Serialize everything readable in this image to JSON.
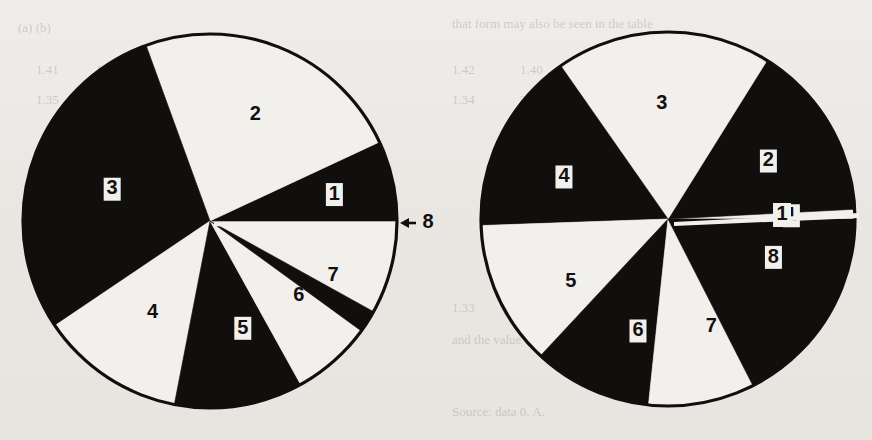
{
  "figure": {
    "title": "",
    "background_color": "#eceae6",
    "ink_color": "#100f0e",
    "paper_color": "#f2f0ec"
  },
  "ghost_text": [
    {
      "text": "(a)  (b)",
      "x": 18,
      "y": 20
    },
    {
      "text": "that   form   may   also   be   seen   in   the   table",
      "x": 452,
      "y": 16
    },
    {
      "text": "1.41",
      "x": 36,
      "y": 62
    },
    {
      "text": "1.38",
      "x": 96,
      "y": 62
    },
    {
      "text": "21",
      "x": 160,
      "y": 62
    },
    {
      "text": "1.42",
      "x": 452,
      "y": 62
    },
    {
      "text": "1.40",
      "x": 520,
      "y": 62
    },
    {
      "text": "23",
      "x": 586,
      "y": 62
    },
    {
      "text": "1.35",
      "x": 36,
      "y": 92
    },
    {
      "text": "2.06",
      "x": 96,
      "y": 92
    },
    {
      "text": "1.44",
      "x": 160,
      "y": 92
    },
    {
      "text": "1.34",
      "x": 452,
      "y": 92
    },
    {
      "text": "2.01",
      "x": 520,
      "y": 92
    },
    {
      "text": "1.46",
      "x": 586,
      "y": 92
    },
    {
      "text": "1.33",
      "x": 452,
      "y": 300
    },
    {
      "text": "0.91",
      "x": 520,
      "y": 300
    },
    {
      "text": "1.52",
      "x": 586,
      "y": 300
    },
    {
      "text": "and   the   value   of   (1)   is   then   taken   as",
      "x": 452,
      "y": 332
    },
    {
      "text": "Source:  data  0.  A.",
      "x": 452,
      "y": 404
    }
  ],
  "chart_data": [
    {
      "id": "left-pie",
      "type": "pie",
      "title": "",
      "caption": "",
      "center": {
        "x": 210,
        "y": 221
      },
      "radius": 187,
      "start_angle_deg": 0,
      "direction": "counterclockwise",
      "legend": "none",
      "labels_inside": true,
      "slices": [
        {
          "label": "1",
          "value": 25.0,
          "fill": "black",
          "label_fill": "light-box",
          "label_angle_deg": 12.0,
          "label_r_frac": 0.68
        },
        {
          "label": "2",
          "value": 85.0,
          "fill": "white",
          "label_fill": "dark",
          "label_angle_deg": 67.0,
          "label_r_frac": 0.62
        },
        {
          "label": "3",
          "value": 104.0,
          "fill": "black",
          "label_fill": "light-box",
          "label_angle_deg": 162.0,
          "label_r_frac": 0.55
        },
        {
          "label": "4",
          "value": 45.0,
          "fill": "white",
          "label_fill": "dark",
          "label_angle_deg": 238.0,
          "label_r_frac": 0.58
        },
        {
          "label": "5",
          "value": 40.0,
          "fill": "black",
          "label_fill": "light-box",
          "label_angle_deg": 287.0,
          "label_r_frac": 0.6
        },
        {
          "label": "6",
          "value": 22.0,
          "fill": "white",
          "label_fill": "dark",
          "label_angle_deg": 320.0,
          "label_r_frac": 0.62
        },
        {
          "label": "7",
          "value": 3.0,
          "fill": "white",
          "label_fill": "dark",
          "label_angle_deg": 336.0,
          "label_r_frac": 0.72
        },
        {
          "label": "8",
          "value": 7.0,
          "fill": "black",
          "label_fill": "dark-outside-arrow",
          "label_angle_deg": 355.0,
          "label_r_frac": 1.15
        }
      ],
      "annotations": [
        {
          "kind": "arrow-to-slice",
          "text": "8",
          "points_to": "slice-8",
          "x": 415,
          "y": 223
        }
      ]
    },
    {
      "id": "right-pie",
      "type": "pie",
      "title": "",
      "caption": "",
      "center": {
        "x": 668,
        "y": 219
      },
      "radius": 187,
      "start_angle_deg": 0,
      "direction": "counterclockwise",
      "legend": "none",
      "labels_inside": true,
      "slices": [
        {
          "label": "1",
          "value": 3.0,
          "fill": "white",
          "label_fill": "dark-box",
          "label_angle_deg": 1.5,
          "label_r_frac": 0.66
        },
        {
          "label": "2",
          "value": 55.0,
          "fill": "black",
          "label_fill": "dark-box",
          "label_angle_deg": 30.0,
          "label_r_frac": 0.62
        },
        {
          "label": "3",
          "value": 67.0,
          "fill": "white",
          "label_fill": "dark",
          "label_angle_deg": 93.0,
          "label_r_frac": 0.62
        },
        {
          "label": "4",
          "value": 57.0,
          "fill": "black",
          "label_fill": "dark-box",
          "label_angle_deg": 158.0,
          "label_r_frac": 0.6
        },
        {
          "label": "5",
          "value": 45.0,
          "fill": "white",
          "label_fill": "dark",
          "label_angle_deg": 213.0,
          "label_r_frac": 0.62
        },
        {
          "label": "6",
          "value": 37.0,
          "fill": "black",
          "label_fill": "dark-box",
          "label_angle_deg": 255.0,
          "label_r_frac": 0.62
        },
        {
          "label": "7",
          "value": 33.0,
          "fill": "white",
          "label_fill": "dark",
          "label_angle_deg": 292.0,
          "label_r_frac": 0.62
        },
        {
          "label": "8",
          "value": 63.0,
          "fill": "black",
          "label_fill": "dark-box",
          "label_angle_deg": 340.0,
          "label_r_frac": 0.6
        }
      ],
      "annotations": [
        {
          "kind": "pointer-line",
          "text": "1",
          "points_to": "slice-1",
          "x": 800,
          "y": 219
        }
      ]
    }
  ]
}
